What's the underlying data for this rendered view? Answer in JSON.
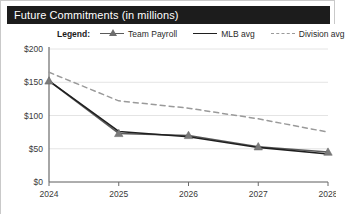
{
  "card": {
    "title": "Future Commitments (in millions)"
  },
  "legend": {
    "title": "Legend:",
    "entries": [
      {
        "label": "Team Payroll",
        "color": "#5a5a5a",
        "style": "line-marker",
        "marker": "triangle"
      },
      {
        "label": "MLB avg",
        "color": "#1f1f1f",
        "style": "line",
        "marker": "none"
      },
      {
        "label": "Division avg",
        "color": "#9a9a9a",
        "style": "dashed",
        "marker": "none"
      }
    ]
  },
  "chart_data": {
    "type": "line",
    "title": "Future Commitments (in millions)",
    "xlabel": "",
    "ylabel": "",
    "x": [
      2024,
      2025,
      2026,
      2027,
      2028
    ],
    "categories": [
      "2024",
      "2025",
      "2026",
      "2027",
      "2028"
    ],
    "xtick_labels": [
      "2024",
      "2025",
      "2026",
      "2027",
      "2028"
    ],
    "ytick_labels": [
      "$0",
      "$50",
      "$100",
      "$150",
      "$200"
    ],
    "ytick_values": [
      0,
      50,
      100,
      150,
      200
    ],
    "ylim": [
      0,
      200
    ],
    "xlim": [
      2024,
      2028
    ],
    "grid": true,
    "legend_position": "top",
    "series": [
      {
        "name": "Team Payroll",
        "color": "#5a5a5a",
        "style": "solid",
        "marker": "triangle",
        "values": [
          152,
          73,
          70,
          53,
          45
        ]
      },
      {
        "name": "MLB avg",
        "color": "#1f1f1f",
        "style": "solid",
        "marker": "none",
        "values": [
          152,
          76,
          68,
          52,
          42
        ]
      },
      {
        "name": "Division avg",
        "color": "#9a9a9a",
        "style": "dashed",
        "marker": "none",
        "values": [
          165,
          122,
          111,
          95,
          75
        ]
      }
    ]
  },
  "axes": {
    "y_labels": [
      "$200",
      "$150",
      "$100",
      "$50",
      "$0"
    ],
    "x_labels": [
      "2024",
      "2025",
      "2026",
      "2027",
      "2028"
    ]
  },
  "colors": {
    "title_bar_bg": "#1c1c1c",
    "title_bar_text": "#ffffff",
    "grid": "#e4e4e4",
    "axis": "#6b6b6b",
    "plot_bg": "#ffffff"
  }
}
